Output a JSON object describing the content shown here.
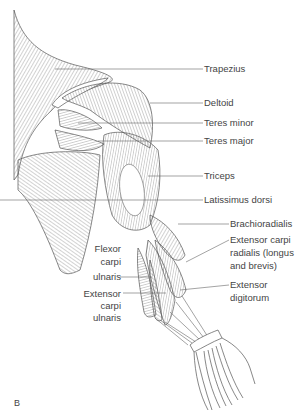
{
  "figure": {
    "panel_letter": "B",
    "line_color": "#555555",
    "background": "#ffffff"
  },
  "labels_right": [
    {
      "id": "trapezius",
      "text": "Trapezius",
      "y": 69
    },
    {
      "id": "deltoid",
      "text": "Deltoid",
      "y": 103
    },
    {
      "id": "teres-minor",
      "text": "Teres minor",
      "y": 123
    },
    {
      "id": "teres-major",
      "text": "Teres major",
      "y": 141
    },
    {
      "id": "triceps",
      "text": "Triceps",
      "y": 176
    },
    {
      "id": "latissimus-dorsi",
      "text": "Latissimus dorsi",
      "y": 200
    },
    {
      "id": "brachioradialis",
      "text": "Brachioradialis",
      "y": 224
    },
    {
      "id": "ecr-line1",
      "text": "Extensor carpi",
      "y": 240
    },
    {
      "id": "ecr-line2",
      "text": "radialis (longus",
      "y": 253
    },
    {
      "id": "ecr-line3",
      "text": "and brevis)",
      "y": 266
    },
    {
      "id": "ed-line1",
      "text": "Extensor",
      "y": 285
    },
    {
      "id": "ed-line2",
      "text": "digitorum",
      "y": 298
    }
  ],
  "labels_left": [
    {
      "id": "fcu-line1",
      "text": "Flexor",
      "y": 248
    },
    {
      "id": "fcu-line2",
      "text": "carpi",
      "y": 261
    },
    {
      "id": "fcu-line3",
      "text": "ulnaris",
      "y": 274
    },
    {
      "id": "ecu-line1",
      "text": "Extensor",
      "y": 290
    },
    {
      "id": "ecu-line2",
      "text": "carpi",
      "y": 303
    },
    {
      "id": "ecu-line3",
      "text": "ulnaris",
      "y": 316
    }
  ]
}
